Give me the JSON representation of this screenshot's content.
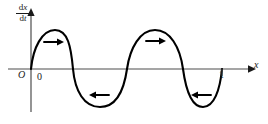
{
  "figure": {
    "kind": "phase-line-diagram",
    "caption_present": false,
    "background_color": "#ffffff",
    "curve_color": "#000000",
    "axis_color": "#4d4d4d",
    "label_color": "#1a1a1a"
  },
  "axes": {
    "y_axis": {
      "label_numerator": "d",
      "label_numerator_var": "x",
      "label_denominator": "d",
      "label_denominator_var": "t",
      "label_text": "dx/dt",
      "has_arrowhead": true
    },
    "x_axis": {
      "label": "x",
      "has_arrowhead": true
    },
    "origin_label": "O",
    "ticks": [
      {
        "label": "0",
        "x_px": 40
      },
      {
        "label": "1",
        "x_px": 221
      }
    ]
  },
  "arrows": [
    {
      "name": "flow-arrow-1",
      "direction": "right",
      "glyph": "→",
      "region": "first-hump-positive"
    },
    {
      "name": "flow-arrow-2",
      "direction": "left",
      "glyph": "←",
      "region": "first-trough-negative"
    },
    {
      "name": "flow-arrow-3",
      "direction": "right",
      "glyph": "→",
      "region": "second-hump-positive"
    },
    {
      "name": "flow-arrow-4",
      "direction": "left",
      "glyph": "←",
      "region": "second-trough-negative"
    }
  ],
  "chart_data": {
    "type": "line",
    "title": "",
    "xlabel": "x",
    "ylabel": "dx/dt",
    "grid": false,
    "legend": null,
    "axis_origin_px": {
      "x": 31,
      "y": 69
    },
    "xlim_px": [
      31,
      250
    ],
    "zero_crossings_px": [
      31,
      73,
      127,
      183,
      222
    ],
    "extrema_px": [
      {
        "type": "maximum",
        "x": 55,
        "y": 30
      },
      {
        "type": "minimum",
        "x": 100,
        "y": 107
      },
      {
        "type": "maximum",
        "x": 155,
        "y": 30
      },
      {
        "type": "minimum",
        "x": 203,
        "y": 107
      }
    ],
    "series": [
      {
        "name": "dx/dt vs x",
        "path": "M31,69 C33,48 42,30 55,30 C68,30 71,47 73,69 C75,91 84,107 100,107 C116,107 124,90 127,69 C130,48 140,30 155,30 C170,30 180,47 183,69 C186,91 192,107 203,107 C214,107 220,90 222,69"
      }
    ]
  }
}
